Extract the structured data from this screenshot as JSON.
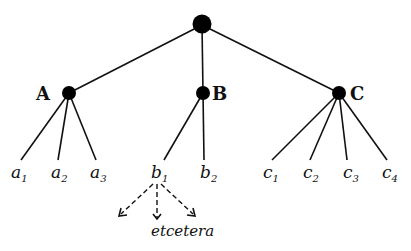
{
  "diagram": {
    "type": "tree",
    "root": {
      "label": ""
    },
    "level1": [
      {
        "label": "A",
        "children": [
          {
            "base": "a",
            "sub": "1"
          },
          {
            "base": "a",
            "sub": "2"
          },
          {
            "base": "a",
            "sub": "3"
          }
        ]
      },
      {
        "label": "B",
        "children": [
          {
            "base": "b",
            "sub": "1"
          },
          {
            "base": "b",
            "sub": "2"
          }
        ]
      },
      {
        "label": "C",
        "children": [
          {
            "base": "c",
            "sub": "1"
          },
          {
            "base": "c",
            "sub": "2"
          },
          {
            "base": "c",
            "sub": "3"
          },
          {
            "base": "c",
            "sub": "4"
          }
        ]
      }
    ],
    "continuation": {
      "from": "b1",
      "label": "etcetera"
    }
  }
}
